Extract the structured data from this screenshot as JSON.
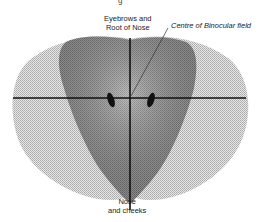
{
  "diagram": {
    "type": "binocular-visual-field",
    "cutoff_title_fragment": "g",
    "labels": {
      "top_line1": "Eyebrows and",
      "top_line2": "Root of Nose",
      "centre": "Centre of Binocular field",
      "bottom_line1": "Nose",
      "bottom_line2": "and cheeks"
    },
    "regions": [
      {
        "name": "monocular-field",
        "shade": "light stipple",
        "color": "#cfcfcf"
      },
      {
        "name": "binocular-field",
        "shade": "dark stipple",
        "color": "#8a8a8a"
      }
    ],
    "markers": [
      {
        "name": "left-blind-spot"
      },
      {
        "name": "right-blind-spot"
      }
    ],
    "axes": [
      "horizontal-meridian",
      "vertical-meridian"
    ]
  }
}
